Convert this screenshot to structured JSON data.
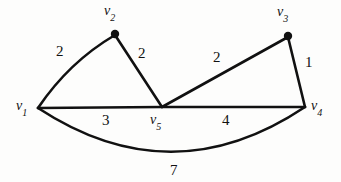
{
  "figure": {
    "type": "weighted-undirected-graph-diagram",
    "background_color": "#fdfdfc",
    "stroke_color": "#111111",
    "width": 341,
    "height": 182
  },
  "vertices": [
    {
      "id": "v1",
      "label_v": "v",
      "label_sub": "1",
      "x": 38,
      "y": 108,
      "dot": false,
      "label_x": 16,
      "label_y": 99
    },
    {
      "id": "v2",
      "label_v": "v",
      "label_sub": "2",
      "x": 115,
      "y": 34,
      "dot": true,
      "label_x": 104,
      "label_y": 4
    },
    {
      "id": "v3",
      "label_v": "v",
      "label_sub": "3",
      "x": 288,
      "y": 36,
      "dot": true,
      "label_x": 277,
      "label_y": 5
    },
    {
      "id": "v4",
      "label_v": "v",
      "label_sub": "4",
      "x": 305,
      "y": 107,
      "dot": false,
      "label_x": 311,
      "label_y": 99
    },
    {
      "id": "v5",
      "label_v": "v",
      "label_sub": "5",
      "x": 162,
      "y": 107,
      "dot": false,
      "label_x": 150,
      "label_y": 113
    }
  ],
  "edges": [
    {
      "from": "v1",
      "to": "v2",
      "weight": "2",
      "label_x": 56,
      "label_y": 44,
      "shape": "curve"
    },
    {
      "from": "v2",
      "to": "v5",
      "weight": "2",
      "label_x": 138,
      "label_y": 46,
      "shape": "line"
    },
    {
      "from": "v5",
      "to": "v3",
      "weight": "2",
      "label_x": 213,
      "label_y": 50,
      "shape": "line"
    },
    {
      "from": "v3",
      "to": "v4",
      "weight": "1",
      "label_x": 305,
      "label_y": 55,
      "shape": "line"
    },
    {
      "from": "v1",
      "to": "v5",
      "weight": "3",
      "label_x": 102,
      "label_y": 113,
      "shape": "line"
    },
    {
      "from": "v5",
      "to": "v4",
      "weight": "4",
      "label_x": 222,
      "label_y": 113,
      "shape": "line"
    },
    {
      "from": "v1",
      "to": "v4",
      "weight": "7",
      "label_x": 170,
      "label_y": 163,
      "shape": "arc"
    }
  ]
}
